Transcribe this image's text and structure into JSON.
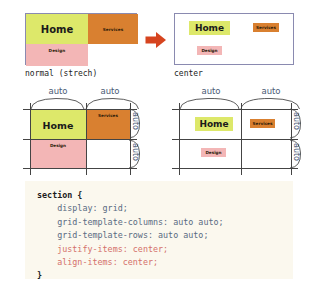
{
  "diagram": {
    "before": {
      "caption": "normal (strech)",
      "cells": [
        {
          "label": "Home",
          "color": "#dde86a"
        },
        {
          "label": "Services",
          "color": "#d98030"
        },
        {
          "label": "Design",
          "color": "#f3b6b6"
        }
      ]
    },
    "after": {
      "caption": "center",
      "cells": [
        {
          "label": "Home",
          "color": "#dde86a"
        },
        {
          "label": "Services",
          "color": "#d98030"
        },
        {
          "label": "Design",
          "color": "#f3b6b6"
        }
      ]
    },
    "arrow": {
      "icon": "right-arrow-icon",
      "color": "#d6441f"
    }
  },
  "track_diagram_left": {
    "columns": [
      "auto",
      "auto"
    ],
    "rows": [
      "auto",
      "auto"
    ],
    "cells": [
      {
        "label": "Home",
        "color": "#dde86a"
      },
      {
        "label": "Services",
        "color": "#d98030"
      },
      {
        "label": "Design",
        "color": "#f3b6b6"
      }
    ]
  },
  "track_diagram_right": {
    "columns": [
      "auto",
      "auto"
    ],
    "rows": [
      "auto",
      "auto"
    ],
    "cells": [
      {
        "label": "Home",
        "color": "#dde86a"
      },
      {
        "label": "Services",
        "color": "#d98030"
      },
      {
        "label": "Design",
        "color": "#f3b6b6"
      }
    ]
  },
  "code": {
    "background": "#fbf8ee",
    "lines": [
      {
        "text": "section {",
        "style": "selector"
      },
      {
        "text": "    display: grid;",
        "style": "property"
      },
      {
        "text": "    grid-template-columns: auto auto;",
        "style": "property"
      },
      {
        "text": "    grid-template-rows: auto auto;",
        "style": "property"
      },
      {
        "text": "    justify-items: center;",
        "style": "highlight"
      },
      {
        "text": "    align-items: center;",
        "style": "highlight"
      },
      {
        "text": "}",
        "style": "selector"
      }
    ]
  }
}
